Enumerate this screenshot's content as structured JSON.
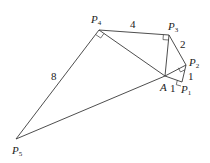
{
  "diagram": {
    "type": "spiral-of-right-triangles",
    "vertices": {
      "A": {
        "label": "A",
        "sub": "",
        "x": 165,
        "y": 76
      },
      "P1": {
        "label": "P",
        "sub": "1",
        "x": 182,
        "y": 82
      },
      "P2": {
        "label": "P",
        "sub": "2",
        "x": 186,
        "y": 65
      },
      "P3": {
        "label": "P",
        "sub": "3",
        "x": 169,
        "y": 35
      },
      "P4": {
        "label": "P",
        "sub": "4",
        "x": 99,
        "y": 30
      },
      "P5": {
        "label": "P",
        "sub": "5",
        "x": 16,
        "y": 139
      }
    },
    "edge_labels": {
      "A_P1": "1",
      "P1_P2": "1",
      "P2_P3": "2",
      "P3_P4": "4",
      "P4_P5": "8"
    },
    "right_angles_at": [
      "P1",
      "P2",
      "P3",
      "P4"
    ]
  }
}
